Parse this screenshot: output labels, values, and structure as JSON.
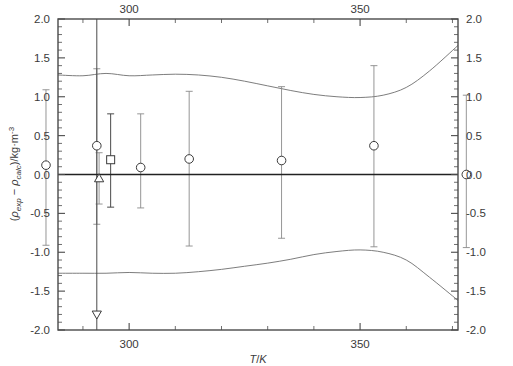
{
  "figure": {
    "kind": "deviation-plot",
    "background": "#ffffff",
    "frame_color": "#4a4a4a",
    "marker_color": "#3a3a3a",
    "errorbar_color": "#8a8a8a",
    "band_color": "#6e6e6e"
  },
  "axes": {
    "x_label_parts": {
      "var": "T",
      "sep": "/",
      "unit": "K"
    },
    "x_label_text": "T/K",
    "y_label_text": "(ρexp - ρcalc)/kg·m-3",
    "y_label_parts": {
      "open": "(",
      "rho1": "ρ",
      "sub1": "exp",
      "minus": " − ",
      "rho2": "ρ",
      "sub2": "calc",
      "close": ")/kg·m",
      "sup": "-3"
    },
    "x_major_ticks": [
      300,
      350
    ],
    "x_major_labels": [
      "300",
      "350"
    ],
    "x_minor_step": 10,
    "y_major_ticks": [
      -2.0,
      -1.5,
      -1.0,
      -0.5,
      0.0,
      0.5,
      1.0,
      1.5,
      2.0
    ],
    "y_major_labels": [
      "-2.0",
      "-1.5",
      "-1.0",
      "-0.5",
      "0.0",
      "0.5",
      "1.0",
      "1.5",
      "2.0"
    ],
    "y_minor_step": 0.1,
    "top_axis_labeled": true,
    "right_axis_labeled": true,
    "grid": false
  },
  "chart_data": {
    "type": "scatter",
    "title": "",
    "xlabel": "T/K",
    "ylabel": "(ρexp - ρcalc)/kg·m-3",
    "xlim": [
      284.6,
      371.2
    ],
    "ylim": [
      -2.0,
      2.0
    ],
    "grid": false,
    "legend": "none",
    "zero_reference_line": 0.0,
    "series": [
      {
        "name": "circle-series",
        "marker": "circle",
        "x": [
          271.0,
          282.0,
          293.0,
          302.5,
          313.0,
          333.0,
          353.0,
          373.0
        ],
        "y": [
          0.41,
          0.12,
          0.37,
          0.09,
          0.2,
          0.18,
          0.37,
          0.0
        ],
        "err_up": [
          1.09,
          0.97,
          0.99,
          0.69,
          0.87,
          0.95,
          1.03,
          1.02
        ],
        "err_down": [
          0.99,
          1.03,
          1.01,
          0.52,
          1.12,
          1.0,
          1.3,
          0.94
        ]
      },
      {
        "name": "square-series",
        "marker": "square",
        "x": [
          271.0,
          296.0
        ],
        "y": [
          0.05,
          0.19
        ],
        "err_up": [
          0.6,
          0.59
        ],
        "err_down": [
          0.63,
          0.61
        ]
      },
      {
        "name": "triangle-up-series",
        "marker": "triangle-up",
        "x": [
          293.5
        ],
        "y": [
          -0.05
        ],
        "err_up": [
          0.33
        ],
        "err_down": [
          0.33
        ]
      },
      {
        "name": "triangle-down-series",
        "marker": "triangle-down",
        "x": [
          293.0
        ],
        "y": [
          -1.8
        ],
        "err_up": [
          3.8
        ],
        "err_down": [
          0.2
        ]
      }
    ],
    "uncertainty_band": {
      "name": "expanded-uncertainty-envelope",
      "upper_x": [
        284.6,
        290,
        295,
        300,
        305,
        310,
        315,
        320,
        325,
        330,
        335,
        340,
        345,
        350,
        355,
        360,
        365,
        371.2
      ],
      "upper_y": [
        1.28,
        1.27,
        1.3,
        1.27,
        1.28,
        1.29,
        1.28,
        1.25,
        1.2,
        1.14,
        1.08,
        1.03,
        1.0,
        0.99,
        1.02,
        1.12,
        1.33,
        1.66
      ],
      "lower_x": [
        284.6,
        290,
        295,
        300,
        305,
        310,
        315,
        320,
        325,
        330,
        335,
        340,
        345,
        350,
        355,
        360,
        365,
        371.2
      ],
      "lower_y": [
        -1.27,
        -1.27,
        -1.27,
        -1.26,
        -1.27,
        -1.27,
        -1.25,
        -1.22,
        -1.18,
        -1.14,
        -1.09,
        -1.03,
        -0.99,
        -0.97,
        -1.0,
        -1.1,
        -1.32,
        -1.62
      ]
    }
  }
}
